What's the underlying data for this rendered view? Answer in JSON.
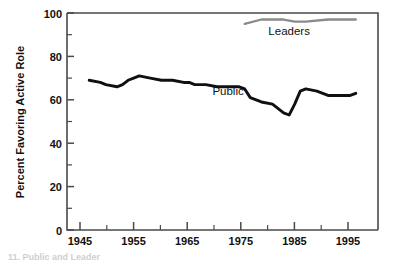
{
  "figure": {
    "caption_fragment": "11. Public and Leader"
  },
  "chart_data": {
    "type": "line",
    "title": "",
    "xlabel": "",
    "ylabel": "Percent Favoring Active Role",
    "xlim": [
      1943,
      1999
    ],
    "ylim": [
      0,
      100
    ],
    "grid": false,
    "legend_position": "inline-labels",
    "x_ticks": [
      1945,
      1955,
      1965,
      1975,
      1985,
      1995
    ],
    "x_tick_labels": [
      "1945",
      "1955",
      "1965",
      "1975",
      "1985",
      "1995"
    ],
    "x_minor_ticks": [
      1950,
      1960,
      1970,
      1980,
      1990
    ],
    "y_ticks": [
      0,
      20,
      40,
      60,
      80,
      100
    ],
    "y_tick_labels": [
      "0",
      "20",
      "40",
      "60",
      "80",
      "100"
    ],
    "y_minor_ticks": [
      10,
      30,
      50,
      70,
      90
    ],
    "annotations": [
      {
        "text": "Public",
        "x": 1972,
        "y": 62,
        "color": "#111111"
      },
      {
        "text": "Leaders",
        "x": 1983,
        "y": 90,
        "color": "#111111"
      }
    ],
    "series": [
      {
        "name": "Public",
        "color": "#101010",
        "x": [
          1947,
          1949,
          1950,
          1952,
          1953,
          1954,
          1955,
          1956,
          1958,
          1960,
          1962,
          1964,
          1965,
          1966,
          1968,
          1970,
          1972,
          1974,
          1975,
          1976,
          1978,
          1980,
          1982,
          1983,
          1984,
          1985,
          1986,
          1988,
          1990,
          1992,
          1994,
          1995
        ],
        "values": [
          69,
          68,
          67,
          66,
          67,
          69,
          70,
          71,
          70,
          69,
          69,
          68,
          68,
          67,
          67,
          66,
          66,
          66,
          65,
          61,
          59,
          58,
          54,
          53,
          58,
          64,
          65,
          64,
          62,
          62,
          62,
          63
        ]
      },
      {
        "name": "Leaders",
        "color": "#8a8a8a",
        "x": [
          1975,
          1978,
          1980,
          1982,
          1984,
          1986,
          1990,
          1994,
          1995
        ],
        "values": [
          95,
          97,
          97,
          97,
          96,
          96,
          97,
          97,
          97
        ]
      }
    ]
  }
}
